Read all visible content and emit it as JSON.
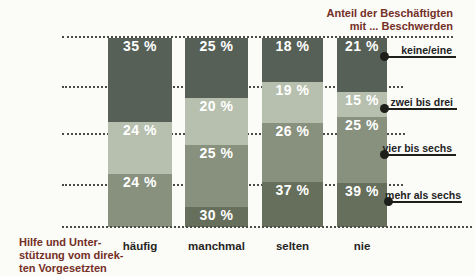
{
  "title": {
    "line1": "Anteil der Beschäftigten",
    "line2": "mit ... Beschwerden"
  },
  "x_axis_title": {
    "line1": "Hilfe und Unter-",
    "line2": "stützung vom direk-",
    "line3": "ten Vorgesetzten"
  },
  "colors": {
    "dark": "#566056",
    "light": "#b7c0ae",
    "medium": "#87917e",
    "dark2": "#656f5c",
    "maroon": "#742f26",
    "ink": "#26261f"
  },
  "chart_data": {
    "type": "bar",
    "stacked": true,
    "not_to_scale": true,
    "unit": "%",
    "categories": [
      "häufig",
      "manchmal",
      "selten",
      "nie"
    ],
    "series": [
      {
        "name": "keine/eine",
        "values": [
          35,
          25,
          18,
          21
        ]
      },
      {
        "name": "zwei bis drei",
        "values": [
          24,
          20,
          19,
          15
        ]
      },
      {
        "name": "vier bis sechs",
        "values": [
          24,
          25,
          26,
          25
        ]
      },
      {
        "name": "mehr als sechs",
        "values": [
          null,
          30,
          37,
          39
        ]
      }
    ],
    "bars": [
      {
        "category": "häufig",
        "segments": [
          {
            "series": "keine/eine",
            "value": 35,
            "value_label": "35 %",
            "shade": "dark",
            "height_px": 84
          },
          {
            "series": "zwei bis drei",
            "value": 24,
            "value_label": "24 %",
            "shade": "light",
            "height_px": 52
          },
          {
            "series": "vier bis sechs",
            "value": 24,
            "value_label": "24 %",
            "shade": "medium",
            "height_px": 53
          }
        ]
      },
      {
        "category": "manchmal",
        "segments": [
          {
            "series": "keine/eine",
            "value": 25,
            "value_label": "25 %",
            "shade": "dark",
            "height_px": 60
          },
          {
            "series": "zwei bis drei",
            "value": 20,
            "value_label": "20 %",
            "shade": "light",
            "height_px": 47
          },
          {
            "series": "vier bis sechs",
            "value": 25,
            "value_label": "25 %",
            "shade": "medium",
            "height_px": 62
          },
          {
            "series": "mehr als sechs",
            "value": 30,
            "value_label": "30 %",
            "shade": "dark2",
            "height_px": 20
          }
        ]
      },
      {
        "category": "selten",
        "segments": [
          {
            "series": "keine/eine",
            "value": 18,
            "value_label": "18 %",
            "shade": "dark",
            "height_px": 44
          },
          {
            "series": "zwei bis drei",
            "value": 19,
            "value_label": "19 %",
            "shade": "light",
            "height_px": 41
          },
          {
            "series": "vier bis sechs",
            "value": 26,
            "value_label": "26 %",
            "shade": "medium",
            "height_px": 59
          },
          {
            "series": "mehr als sechs",
            "value": 37,
            "value_label": "37 %",
            "shade": "dark2",
            "height_px": 45
          }
        ]
      },
      {
        "category": "nie",
        "segments": [
          {
            "series": "keine/eine",
            "value": 21,
            "value_label": "21 %",
            "shade": "dark",
            "height_px": 54
          },
          {
            "series": "zwei bis drei",
            "value": 15,
            "value_label": "15 %",
            "shade": "light",
            "height_px": 25
          },
          {
            "series": "vier bis sechs",
            "value": 25,
            "value_label": "25 %",
            "shade": "medium",
            "height_px": 66
          },
          {
            "series": "mehr als sechs",
            "value": 39,
            "value_label": "39 %",
            "shade": "dark2",
            "height_px": 44
          }
        ]
      }
    ],
    "legend_position": "right",
    "grid": "dotted-horizontal"
  }
}
